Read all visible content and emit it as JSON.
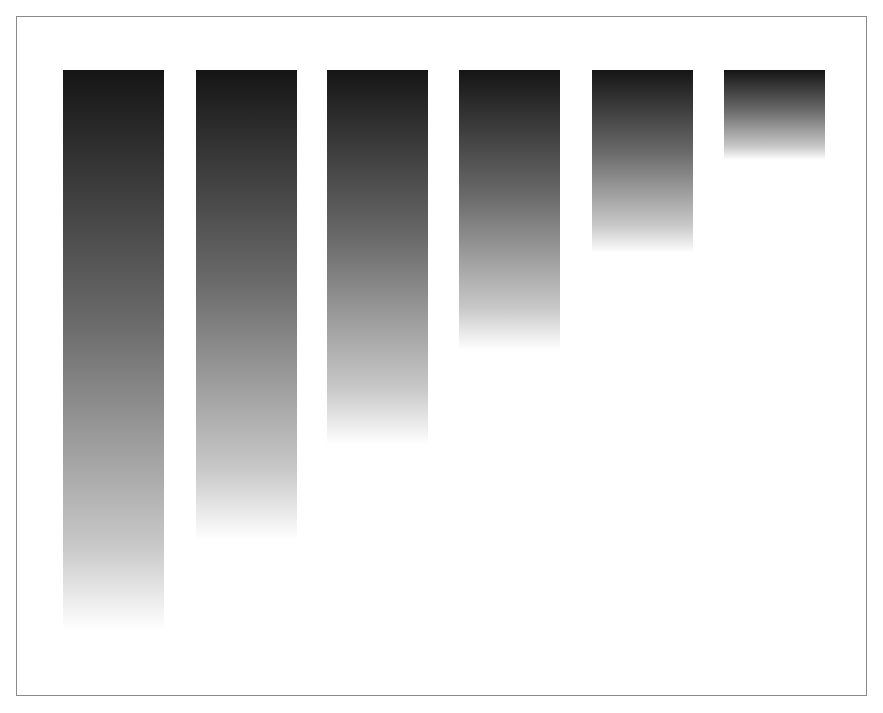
{
  "chart_data": {
    "type": "bar",
    "title": "",
    "xlabel": "",
    "ylabel": "",
    "categories": [
      "",
      "",
      "",
      "",
      "",
      ""
    ],
    "values": [
      560,
      470,
      375,
      280,
      183,
      90
    ],
    "value_basis": "approximate pixel heights measured from screenshot (bars share top edge, fade to white at bottom); no axis or labels shown",
    "orientation": "hanging-from-top",
    "grid": false,
    "legend": null
  },
  "style": {
    "bar_top_color": "#151515",
    "bar_bottom_color": "#ffffff",
    "frame_border_color": "#8a8a8a"
  }
}
